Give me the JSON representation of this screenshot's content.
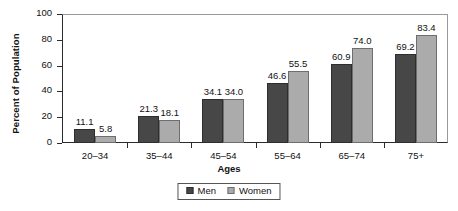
{
  "chart_data": {
    "type": "bar",
    "title": "",
    "subtitle": "",
    "xlabel": "Ages",
    "ylabel": "Percent of Population",
    "categories": [
      "20–34",
      "35–44",
      "45–54",
      "55–64",
      "65–74",
      "75+"
    ],
    "series": [
      {
        "name": "Men",
        "color": "#474747",
        "values": [
          11.1,
          21.3,
          34.1,
          46.6,
          60.9,
          69.2
        ]
      },
      {
        "name": "Women",
        "color": "#ababab",
        "values": [
          5.8,
          18.1,
          34.0,
          55.5,
          74.0,
          83.4
        ]
      }
    ],
    "data_labels": {
      "Men": [
        "11.1",
        "21.3",
        "34.1",
        "46.6",
        "60.9",
        "69.2"
      ],
      "Women": [
        "5.8",
        "18.1",
        "34.0",
        "55.5",
        "74.0",
        "83.4"
      ]
    },
    "ylim": [
      0,
      100
    ],
    "yticks": [
      0,
      20,
      40,
      60,
      80,
      100
    ],
    "ytick_labels": [
      "0",
      "20",
      "40",
      "60",
      "80",
      "100"
    ],
    "grid": false,
    "legend_position": "bottom-center",
    "legend_entries": [
      "Men",
      "Women"
    ]
  },
  "axes": {
    "y_title": "Percent of Population",
    "x_title": "Ages"
  },
  "legend": {
    "items": [
      {
        "label": "Men",
        "swatch": "men-color-swatch"
      },
      {
        "label": "Women",
        "swatch": "women-color-swatch"
      }
    ]
  }
}
